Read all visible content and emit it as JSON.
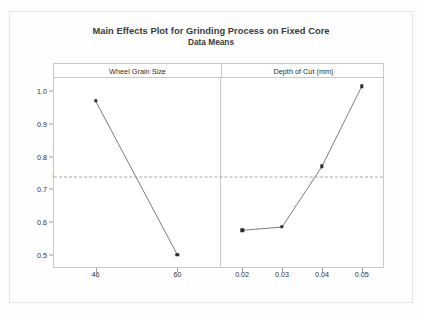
{
  "chart_data": {
    "type": "line",
    "title": "Main Effects Plot for Grinding Process on Fixed Core",
    "subtitle": "Data Means",
    "ylabel": "Ra (μm)",
    "xlabel": "",
    "ylim": [
      0.46,
      1.04
    ],
    "yticks": [
      0.5,
      0.6,
      0.7,
      0.8,
      0.9,
      1.0
    ],
    "ytick_labels": [
      "0.5",
      "0.6",
      "0.7",
      "0.8",
      "0.9",
      "1.0"
    ],
    "grid": false,
    "legend": "none",
    "reference_line": {
      "value": 0.738,
      "style": "dashed",
      "color": "#9aa7c4",
      "label": ""
    },
    "panels": [
      {
        "name": "Wheel Grain Size",
        "categories": [
          "46",
          "60"
        ],
        "values": [
          0.97,
          0.5
        ]
      },
      {
        "name": "Depth of Cut (mm)",
        "categories": [
          "0.02",
          "0.03",
          "0.04",
          "0.05"
        ],
        "values": [
          0.575,
          0.585,
          0.77,
          1.015
        ]
      }
    ],
    "marker": "square",
    "marker_color": "#2b2b2b",
    "line_color": "#6e6e6e"
  }
}
